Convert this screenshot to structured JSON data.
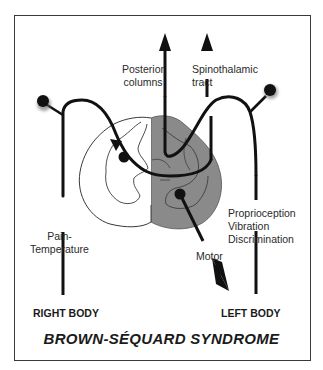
{
  "title": "BROWN-SÉQUARD SYNDROME",
  "labels": {
    "posterior_columns": [
      "Posterior",
      "columns"
    ],
    "spinothalamic_tract": [
      "Spinothalamic",
      "tract"
    ],
    "pain_temperature": [
      "Pain-",
      "Temperature"
    ],
    "proprioception": [
      "Proprioception",
      "Vibration",
      "Discrimination"
    ],
    "motor": "Motor",
    "right_body": "RIGHT BODY",
    "left_body": "LEFT BODY"
  },
  "colors": {
    "lesion_fill": "#8a8a8a",
    "line": "#1a1a1a",
    "border": "#3a3a3a",
    "background": "#ffffff"
  }
}
